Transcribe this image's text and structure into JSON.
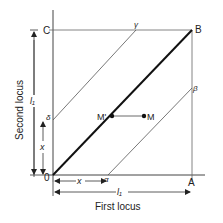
{
  "diagram": {
    "points": {
      "O": {
        "label": "0",
        "x": 53,
        "y": 175
      },
      "A": {
        "label": "A",
        "x": 192,
        "y": 175
      },
      "B": {
        "label": "B",
        "x": 192,
        "y": 30
      },
      "C": {
        "label": "C",
        "x": 53,
        "y": 30
      },
      "M_prime": {
        "label": "M'",
        "x": 112,
        "y": 116
      },
      "M": {
        "label": "M",
        "x": 144,
        "y": 116
      },
      "alpha": {
        "label": "α",
        "x": 108,
        "y": 175
      },
      "beta": {
        "label": "β",
        "x": 192,
        "y": 90
      },
      "gamma": {
        "label": "γ",
        "x": 136,
        "y": 30
      },
      "delta": {
        "label": "δ",
        "x": 53,
        "y": 120
      }
    },
    "axes": {
      "x_label": "First locus",
      "y_label": "Second locus"
    },
    "dimensions": {
      "l1_horizontal": "l₁",
      "l1_vertical": "l₁",
      "x_horizontal": "x",
      "x_vertical": "x"
    },
    "colors": {
      "line": "#333333",
      "thin_line": "#666666",
      "background": "#ffffff"
    }
  }
}
